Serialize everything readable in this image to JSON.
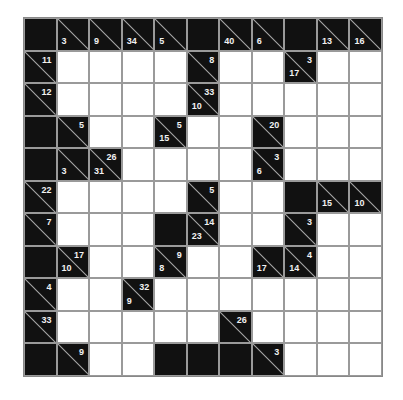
{
  "puzzle": {
    "type": "kakuro",
    "rows": 11,
    "cols": 11,
    "colors": {
      "block": "#111111",
      "empty": "#ffffff",
      "grid_line": "#9a9a9a",
      "clue_text": "#f2f2f2"
    },
    "grid": [
      [
        {
          "t": "B"
        },
        {
          "t": "C",
          "d": "3"
        },
        {
          "t": "C",
          "d": "9"
        },
        {
          "t": "C",
          "d": "34"
        },
        {
          "t": "C",
          "d": "5"
        },
        {
          "t": "B"
        },
        {
          "t": "C",
          "d": "40"
        },
        {
          "t": "C",
          "d": "6"
        },
        {
          "t": "B"
        },
        {
          "t": "C",
          "d": "13"
        },
        {
          "t": "C",
          "d": "16"
        }
      ],
      [
        {
          "t": "C",
          "r": "11"
        },
        {
          "t": "W"
        },
        {
          "t": "W"
        },
        {
          "t": "W"
        },
        {
          "t": "W"
        },
        {
          "t": "C",
          "r": "8"
        },
        {
          "t": "W"
        },
        {
          "t": "W"
        },
        {
          "t": "C",
          "d": "17",
          "r": "3"
        },
        {
          "t": "W"
        },
        {
          "t": "W"
        }
      ],
      [
        {
          "t": "C",
          "r": "12"
        },
        {
          "t": "W"
        },
        {
          "t": "W"
        },
        {
          "t": "W"
        },
        {
          "t": "W"
        },
        {
          "t": "C",
          "d": "10",
          "r": "33"
        },
        {
          "t": "W"
        },
        {
          "t": "W"
        },
        {
          "t": "W"
        },
        {
          "t": "W"
        },
        {
          "t": "W"
        }
      ],
      [
        {
          "t": "B"
        },
        {
          "t": "C",
          "r": "5"
        },
        {
          "t": "W"
        },
        {
          "t": "W"
        },
        {
          "t": "C",
          "d": "15",
          "r": "5"
        },
        {
          "t": "W"
        },
        {
          "t": "W"
        },
        {
          "t": "C",
          "r": "20"
        },
        {
          "t": "W"
        },
        {
          "t": "W"
        },
        {
          "t": "W"
        }
      ],
      [
        {
          "t": "B"
        },
        {
          "t": "C",
          "d": "3"
        },
        {
          "t": "C",
          "d": "31",
          "r": "26"
        },
        {
          "t": "W"
        },
        {
          "t": "W"
        },
        {
          "t": "W"
        },
        {
          "t": "W"
        },
        {
          "t": "C",
          "d": "6",
          "r": "3"
        },
        {
          "t": "W"
        },
        {
          "t": "W"
        },
        {
          "t": "W"
        }
      ],
      [
        {
          "t": "C",
          "r": "22"
        },
        {
          "t": "W"
        },
        {
          "t": "W"
        },
        {
          "t": "W"
        },
        {
          "t": "W"
        },
        {
          "t": "C",
          "r": "5"
        },
        {
          "t": "W"
        },
        {
          "t": "W"
        },
        {
          "t": "B"
        },
        {
          "t": "C",
          "d": "15"
        },
        {
          "t": "C",
          "d": "10"
        }
      ],
      [
        {
          "t": "C",
          "r": "7"
        },
        {
          "t": "W"
        },
        {
          "t": "W"
        },
        {
          "t": "W"
        },
        {
          "t": "B"
        },
        {
          "t": "C",
          "d": "23",
          "r": "14"
        },
        {
          "t": "W"
        },
        {
          "t": "W"
        },
        {
          "t": "C",
          "r": "3"
        },
        {
          "t": "W"
        },
        {
          "t": "W"
        }
      ],
      [
        {
          "t": "B"
        },
        {
          "t": "C",
          "d": "10",
          "r": "17"
        },
        {
          "t": "W"
        },
        {
          "t": "W"
        },
        {
          "t": "C",
          "d": "8",
          "r": "9"
        },
        {
          "t": "W"
        },
        {
          "t": "W"
        },
        {
          "t": "C",
          "d": "17"
        },
        {
          "t": "C",
          "d": "14",
          "r": "4"
        },
        {
          "t": "W"
        },
        {
          "t": "W"
        }
      ],
      [
        {
          "t": "C",
          "r": "4"
        },
        {
          "t": "W"
        },
        {
          "t": "W"
        },
        {
          "t": "C",
          "d": "9",
          "r": "32"
        },
        {
          "t": "W"
        },
        {
          "t": "W"
        },
        {
          "t": "W"
        },
        {
          "t": "W"
        },
        {
          "t": "W"
        },
        {
          "t": "W"
        },
        {
          "t": "W"
        }
      ],
      [
        {
          "t": "C",
          "r": "33"
        },
        {
          "t": "W"
        },
        {
          "t": "W"
        },
        {
          "t": "W"
        },
        {
          "t": "W"
        },
        {
          "t": "W"
        },
        {
          "t": "C",
          "r": "26"
        },
        {
          "t": "W"
        },
        {
          "t": "W"
        },
        {
          "t": "W"
        },
        {
          "t": "W"
        }
      ],
      [
        {
          "t": "B"
        },
        {
          "t": "C",
          "r": "9"
        },
        {
          "t": "W"
        },
        {
          "t": "W"
        },
        {
          "t": "B"
        },
        {
          "t": "B"
        },
        {
          "t": "B"
        },
        {
          "t": "C",
          "r": "3"
        },
        {
          "t": "W"
        },
        {
          "t": "W"
        },
        {
          "t": "W"
        }
      ]
    ]
  }
}
